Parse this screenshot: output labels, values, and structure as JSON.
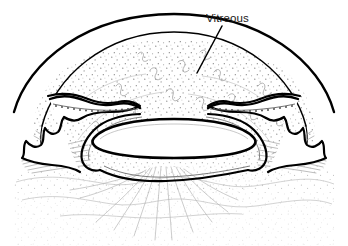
{
  "figure": {
    "kind": "anatomical-line-drawing",
    "background_color": "#ffffff",
    "ink_color": "#000000",
    "faint_ink_color": "#8a8a8a",
    "width": 348,
    "height": 246
  },
  "labels": [
    {
      "id": "vitreous",
      "text": "Vitreous",
      "text_x": 206,
      "text_y": 22,
      "leader_from_x": 222,
      "leader_from_y": 26,
      "leader_to_x": 197,
      "leader_to_y": 73
    }
  ],
  "structures": {
    "cornea_sclera_outer": "outer bold arc spanning the top of the globe",
    "cornea_sclera_inner": "inner parallel arc forming corneal stroma band",
    "iris_left": "bold wavy iris leaf on the left with beaded pigment line",
    "iris_right": "bold wavy iris leaf on the right with beaded pigment line",
    "ciliary_body_left": "left ciliary processes with radiating zonular fibers",
    "ciliary_body_right": "right ciliary processes with radiating zonular fibers",
    "lens": "central white elliptical lens outlined in bold",
    "posterior_capsule": "bold line sweeping below the lens",
    "vitreous_body": "stippled region filling the globe interior",
    "vitreous_fibrils": "faint squiggly collagen fibril marks within the vitreous"
  }
}
